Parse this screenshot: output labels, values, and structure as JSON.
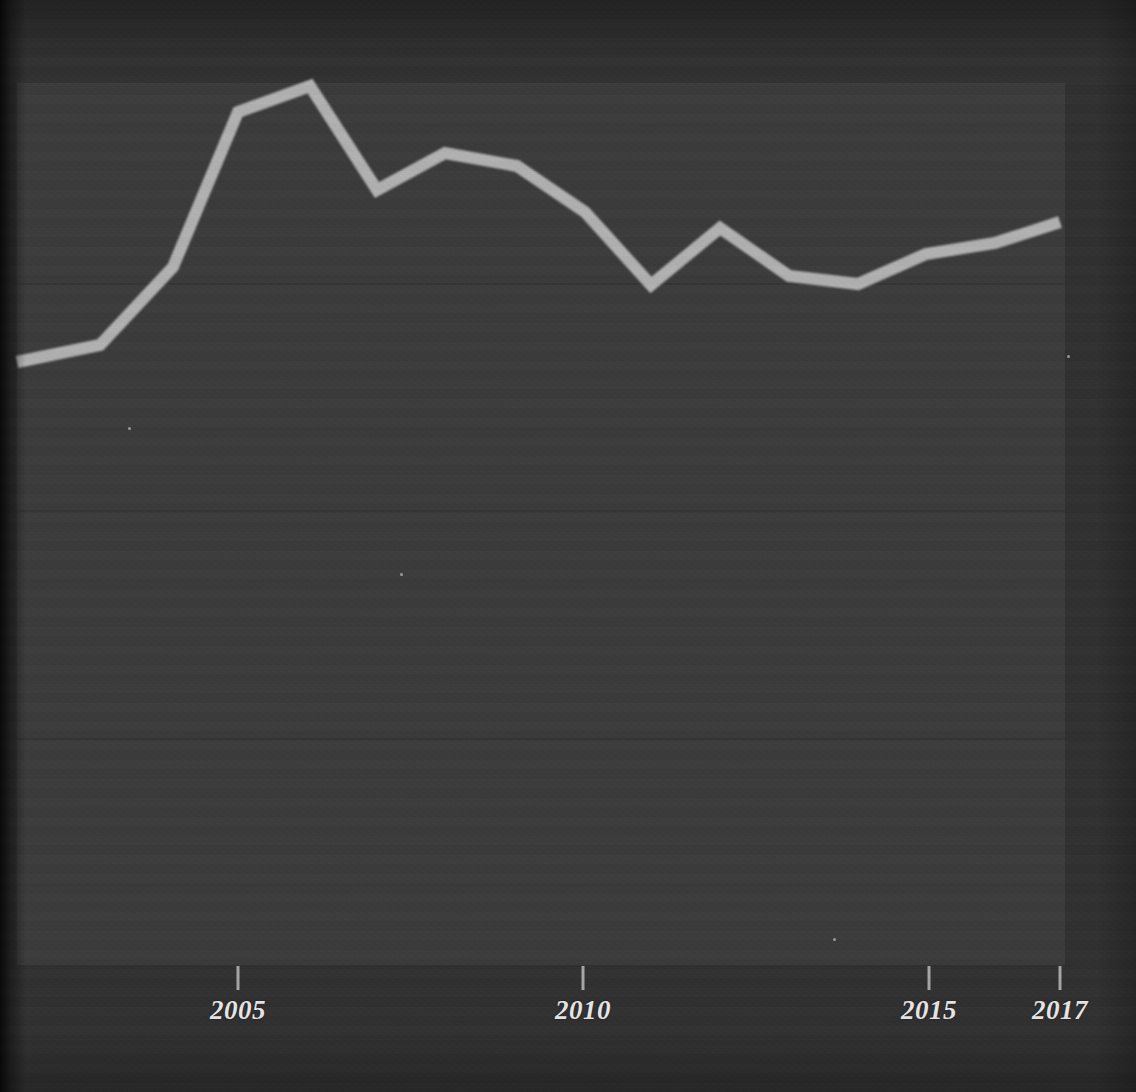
{
  "figure": {
    "background_color": "#303030",
    "panel_color": "#3b3b3b",
    "line_color": "#b2b2b2",
    "axis_color": "#bcbcbc",
    "grid_color": "#353535",
    "tick_label_color": "#e8e8e8"
  },
  "axis": {
    "x_tick_labels": [
      "2005",
      "2010",
      "2015",
      "2017"
    ],
    "x_tick_years": [
      2005,
      2010,
      2015,
      2017
    ],
    "x_tick_px": [
      238,
      583,
      929,
      1060
    ],
    "baseline_y_px": 962,
    "gridlines_y_px": [
      283,
      510,
      738
    ]
  },
  "chart_data": {
    "type": "line",
    "title": "",
    "subtitle": "",
    "xlabel": "",
    "ylabel": "",
    "grid": true,
    "legend": false,
    "xlim": [
      2001.8,
      2017
    ],
    "ylim": [
      0,
      3.9
    ],
    "x": [
      2002,
      2003,
      2004,
      2005,
      2006,
      2007,
      2008,
      2009,
      2010,
      2011,
      2012,
      2013,
      2014,
      2015,
      2016,
      2017
    ],
    "xtick_labels": [
      "2005",
      "2010",
      "2015",
      "2017"
    ],
    "series": [
      {
        "name": "series-1",
        "color": "#b2b2b2",
        "linewidth_px": 12,
        "values": [
          2.65,
          2.95,
          3.0,
          3.68,
          3.8,
          3.34,
          3.51,
          3.45,
          3.26,
          2.93,
          3.18,
          2.97,
          2.93,
          3.05,
          3.09,
          3.2
        ]
      }
    ],
    "points_px": [
      [
        17,
        362
      ],
      [
        100,
        345
      ],
      [
        173,
        267
      ],
      [
        238,
        112
      ],
      [
        310,
        86
      ],
      [
        377,
        190
      ],
      [
        445,
        153
      ],
      [
        517,
        166
      ],
      [
        585,
        212
      ],
      [
        651,
        285
      ],
      [
        720,
        228
      ],
      [
        789,
        276
      ],
      [
        858,
        284
      ],
      [
        926,
        254
      ],
      [
        995,
        243
      ],
      [
        1060,
        222
      ]
    ]
  }
}
